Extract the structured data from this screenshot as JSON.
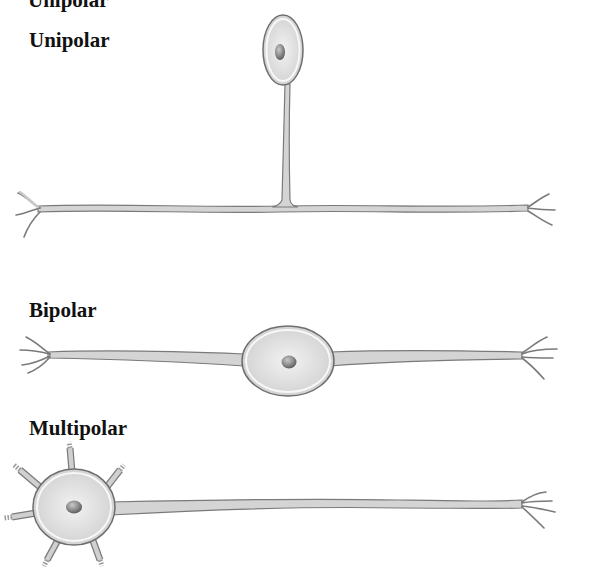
{
  "diagram": {
    "top_fragment_text": "Unipolar",
    "neurons": [
      {
        "id": "unipolar",
        "label": "Unipolar"
      },
      {
        "id": "bipolar",
        "label": "Bipolar"
      },
      {
        "id": "multipolar",
        "label": "Multipolar"
      }
    ],
    "colors": {
      "process_fill": "#d4d4d4",
      "process_stroke": "#7a7a7a",
      "soma_outer": "#f4f4f4",
      "soma_inner": "#dcdcdc",
      "soma_stroke": "#6e6e6e",
      "nucleus": "#8a8a8a",
      "label": "#111111"
    }
  }
}
